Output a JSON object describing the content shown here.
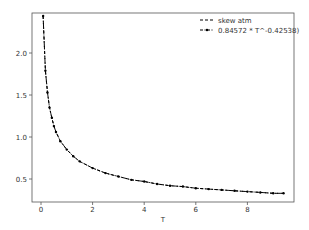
{
  "chart_data": {
    "type": "line",
    "title": "",
    "xlabel": "T",
    "ylabel": "",
    "xlim": [
      -0.4,
      9.8
    ],
    "ylim": [
      0.22,
      2.45
    ],
    "xticks": [
      0,
      2,
      4,
      6,
      8
    ],
    "yticks": [
      0.5,
      1.0,
      1.5,
      2.0
    ],
    "ytick_labels": [
      "0.5",
      "1.0",
      "1.5",
      "2.0"
    ],
    "xtick_labels": [
      "0",
      "2",
      "4",
      "6",
      "8"
    ],
    "grid": false,
    "legend_position": "upper right",
    "series": [
      {
        "name": "skew atm",
        "style": "dashed",
        "color": "#000000",
        "x": [
          0.083,
          0.17,
          0.25,
          0.33,
          0.42,
          0.5,
          0.58,
          0.75,
          1.0,
          1.25,
          1.5,
          2.0,
          2.5,
          3.0,
          3.5,
          4.0,
          4.5,
          5.0,
          5.5,
          6.0,
          6.5,
          7.0,
          7.5,
          8.0,
          8.5,
          9.0,
          9.4
        ],
        "values": [
          2.44,
          1.79,
          1.53,
          1.35,
          1.23,
          1.13,
          1.06,
          0.95,
          0.85,
          0.77,
          0.71,
          0.63,
          0.57,
          0.53,
          0.49,
          0.47,
          0.44,
          0.42,
          0.41,
          0.39,
          0.38,
          0.37,
          0.36,
          0.35,
          0.34,
          0.33,
          0.33
        ]
      },
      {
        "name": "0.84572 * T^-0.42538)",
        "style": "dashed-dot-markers",
        "color": "#000000",
        "formula": {
          "a": 0.84572,
          "b": -0.42538
        },
        "x": [
          0.083,
          0.17,
          0.25,
          0.33,
          0.42,
          0.5,
          0.58,
          0.75,
          1.0,
          1.25,
          1.5,
          2.0,
          2.5,
          3.0,
          3.5,
          4.0,
          4.5,
          5.0,
          5.5,
          6.0,
          6.5,
          7.0,
          7.5,
          8.0,
          8.5,
          9.0,
          9.4
        ],
        "values": [
          2.44,
          1.79,
          1.53,
          1.35,
          1.23,
          1.13,
          1.06,
          0.95,
          0.85,
          0.77,
          0.71,
          0.63,
          0.57,
          0.53,
          0.49,
          0.47,
          0.44,
          0.42,
          0.41,
          0.39,
          0.38,
          0.37,
          0.36,
          0.35,
          0.34,
          0.33,
          0.33
        ]
      }
    ]
  }
}
